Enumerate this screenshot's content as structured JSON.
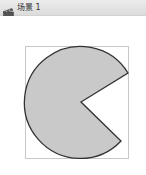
{
  "window": {
    "title": "场景 1",
    "icon": "scene-clapper-icon"
  },
  "stage": {
    "bounding_box": {
      "x": 25,
      "y": 46,
      "width": 103,
      "height": 112,
      "stroke": "#c8c8c8"
    },
    "shape": {
      "type": "pie-sector",
      "center": {
        "x": 81,
        "y": 102
      },
      "radius": 56,
      "mouth_start": {
        "x": 128,
        "y": 73
      },
      "mouth_end": {
        "x": 121,
        "y": 141
      },
      "fill": "#c9c9c9",
      "stroke": "#333333"
    }
  }
}
